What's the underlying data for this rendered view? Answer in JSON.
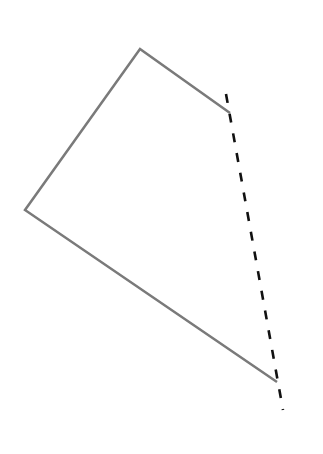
{
  "diagram": {
    "title": "",
    "background": "#ffffff",
    "polyline": {
      "points": [
        [
          230,
          113
        ],
        [
          140,
          49
        ],
        [
          25,
          210
        ],
        [
          277,
          382
        ]
      ],
      "stroke": "#7a7a7a",
      "width": 2.5
    },
    "dashed_line": {
      "from": [
        226,
        94
      ],
      "to": [
        283,
        410
      ],
      "stroke": "#111111",
      "width": 2.6,
      "dash": "9 11"
    }
  }
}
